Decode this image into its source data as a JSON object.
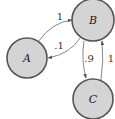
{
  "diagram": {
    "type": "markov-chain-state-diagram",
    "colors": {
      "node_fill": "#d4d4d4",
      "node_stroke": "#555555",
      "edge_stroke": "#777777",
      "text": "#222222"
    },
    "nodes": [
      {
        "id": "A",
        "label": "A"
      },
      {
        "id": "B",
        "label": "B"
      },
      {
        "id": "C",
        "label": "C"
      }
    ],
    "edges": [
      {
        "from": "A",
        "to": "B",
        "label": "1"
      },
      {
        "from": "B",
        "to": "A",
        "label": ".1"
      },
      {
        "from": "B",
        "to": "C",
        "label": ".9"
      },
      {
        "from": "C",
        "to": "B",
        "label": "1"
      }
    ]
  }
}
